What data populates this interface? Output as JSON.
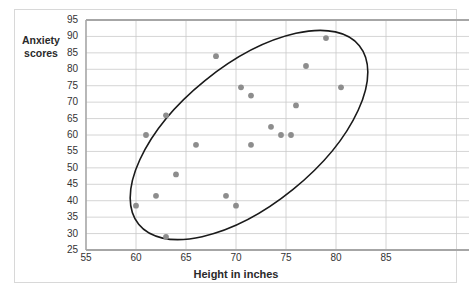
{
  "chart_data": {
    "type": "scatter",
    "title": "",
    "xlabel": "Height in inches",
    "ylabel": "Anxiety\nscores",
    "xlim": [
      55,
      85
    ],
    "ylim": [
      25,
      95
    ],
    "xticks": [
      55,
      60,
      65,
      70,
      75,
      80,
      85
    ],
    "yticks": [
      25,
      30,
      35,
      40,
      45,
      50,
      55,
      60,
      65,
      70,
      75,
      80,
      85,
      90,
      95
    ],
    "grid": "horizontal-and-vertical",
    "legend": "none",
    "point_color": "#8d8d8d",
    "annotation_shape": "ellipse",
    "annotation_note": "hand-drawn ellipse enclosing the positively correlated cloud, major axis from lower-left to upper-right",
    "points": [
      {
        "x": 60,
        "y": 38.5
      },
      {
        "x": 61,
        "y": 60
      },
      {
        "x": 62,
        "y": 41.5
      },
      {
        "x": 63,
        "y": 66
      },
      {
        "x": 63,
        "y": 29
      },
      {
        "x": 64,
        "y": 48
      },
      {
        "x": 66,
        "y": 57
      },
      {
        "x": 68,
        "y": 84
      },
      {
        "x": 69,
        "y": 41.5
      },
      {
        "x": 70,
        "y": 38.5
      },
      {
        "x": 70.5,
        "y": 74.5
      },
      {
        "x": 71.5,
        "y": 72
      },
      {
        "x": 71.5,
        "y": 57
      },
      {
        "x": 73.5,
        "y": 62.5
      },
      {
        "x": 74.5,
        "y": 60
      },
      {
        "x": 75.5,
        "y": 60
      },
      {
        "x": 76,
        "y": 69
      },
      {
        "x": 77,
        "y": 81
      },
      {
        "x": 79,
        "y": 89.5
      },
      {
        "x": 80.5,
        "y": 74.5
      }
    ]
  }
}
